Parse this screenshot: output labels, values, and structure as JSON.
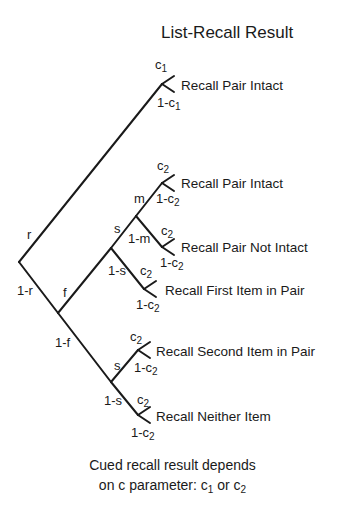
{
  "title": "List-Recall Result",
  "outcomes": {
    "o1": "Recall Pair Intact",
    "o2": "Recall Pair Intact",
    "o3": "Recall Pair Not Intact",
    "o4": "Recall First Item in Pair",
    "o5": "Recall Second Item in Pair",
    "o6": "Recall Neither Item"
  },
  "branch_labels": {
    "r": "r",
    "one_minus_r": "1-r",
    "f": "f",
    "one_minus_f": "1-f",
    "s_upper": "s",
    "one_minus_s_upper": "1-s",
    "m": "m",
    "one_minus_m": "1-m",
    "s_lower": "s",
    "one_minus_s_lower": "1-s",
    "c_base": "c",
    "one_minus_c_base": "1-c",
    "sub1": "1",
    "sub2": "2"
  },
  "footer": {
    "line1": "Cued recall result  depends",
    "line2_prefix": "on c parameter: ",
    "c": "c",
    "sub1": "1",
    "or": " or ",
    "sub2": "2"
  },
  "colors": {
    "line": "#1a1a1a",
    "text": "#1a1a1a",
    "background": "#ffffff"
  }
}
